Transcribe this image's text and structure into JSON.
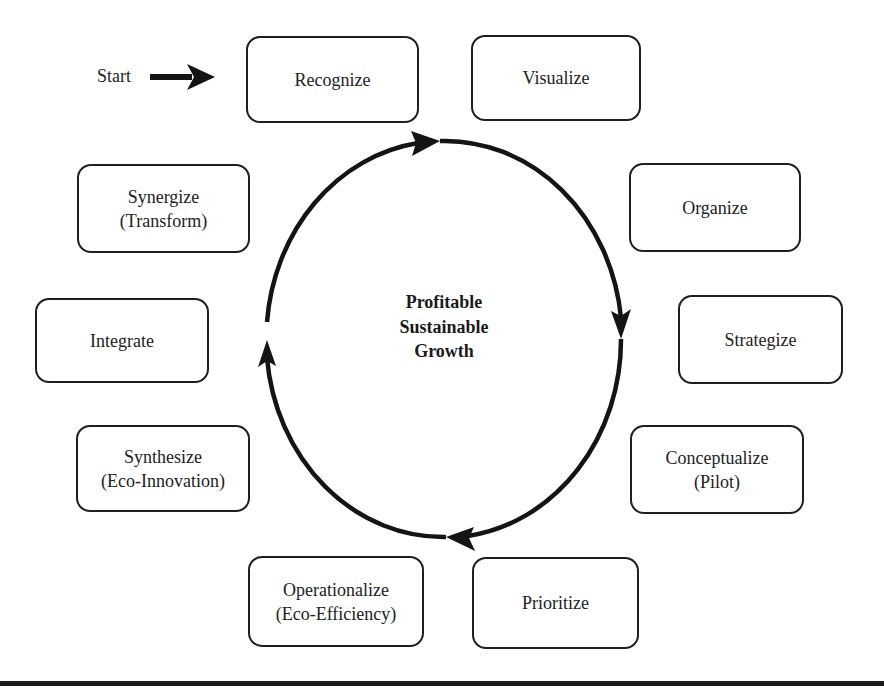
{
  "diagram": {
    "start_label": "Start",
    "center_label": [
      "Profitable",
      "Sustainable",
      "Growth"
    ],
    "steps": [
      {
        "id": "recognize",
        "lines": [
          "Recognize"
        ]
      },
      {
        "id": "visualize",
        "lines": [
          "Visualize"
        ]
      },
      {
        "id": "organize",
        "lines": [
          "Organize"
        ]
      },
      {
        "id": "strategize",
        "lines": [
          "Strategize"
        ]
      },
      {
        "id": "conceptualize",
        "lines": [
          "Conceptualize",
          "(Pilot)"
        ]
      },
      {
        "id": "prioritize",
        "lines": [
          "Prioritize"
        ]
      },
      {
        "id": "operationalize",
        "lines": [
          "Operationalize",
          "(Eco-Efficiency)"
        ]
      },
      {
        "id": "synthesize",
        "lines": [
          "Synthesize",
          "(Eco-Innovation)"
        ]
      },
      {
        "id": "integrate",
        "lines": [
          "Integrate"
        ]
      },
      {
        "id": "synergize",
        "lines": [
          "Synergize",
          "(Transform)"
        ]
      }
    ],
    "cycle_direction": "clockwise",
    "colors": {
      "stroke": "#1a1a1a",
      "background": "#ffffff"
    }
  }
}
